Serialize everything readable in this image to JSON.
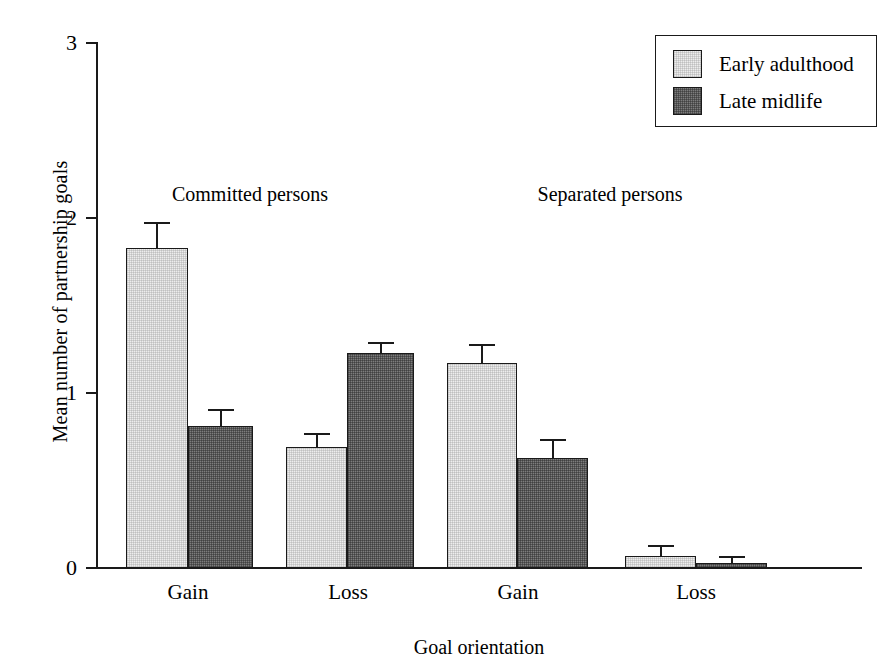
{
  "chart_data": {
    "type": "bar",
    "title": "",
    "xlabel": "Goal orientation",
    "ylabel": "Mean number of partnership goals",
    "ylim": [
      0,
      3
    ],
    "yticks": [
      "0",
      "1",
      "2",
      "3"
    ],
    "ytick_values": [
      0,
      1,
      2,
      3
    ],
    "grid": false,
    "legend_position": "top-right",
    "categories": [
      "Gain",
      "Loss",
      "Gain",
      "Loss"
    ],
    "group_headers": [
      "Committed persons",
      "Separated persons"
    ],
    "series": [
      {
        "name": "Early adulthood",
        "color": "#ededed",
        "values": [
          1.83,
          0.69,
          1.17,
          0.07
        ],
        "errors": [
          0.15,
          0.08,
          0.11,
          0.06
        ]
      },
      {
        "name": "Late midlife",
        "color": "#7d7d7d",
        "values": [
          0.81,
          1.23,
          0.63,
          0.03
        ],
        "errors": [
          0.1,
          0.06,
          0.11,
          0.04
        ]
      }
    ]
  },
  "axes": {
    "y_title": "Mean number of partnership goals",
    "x_title": "Goal orientation",
    "y_tick_labels": [
      "3",
      "2",
      "1",
      "0"
    ]
  },
  "legend": {
    "items": [
      {
        "label": "Early adulthood"
      },
      {
        "label": "Late midlife"
      }
    ]
  },
  "category_labels": [
    "Gain",
    "Loss",
    "Gain",
    "Loss"
  ],
  "group_headers": [
    "Committed persons",
    "Separated persons"
  ],
  "geometry": {
    "baseline_y": 568,
    "pixels_per_unit": 175,
    "bars": [
      {
        "left": 126,
        "width": 62,
        "series": 0,
        "group": 0
      },
      {
        "left": 188,
        "width": 65,
        "series": 1,
        "group": 0
      },
      {
        "left": 286,
        "width": 61,
        "series": 0,
        "group": 1
      },
      {
        "left": 347,
        "width": 67,
        "series": 1,
        "group": 1
      },
      {
        "left": 447,
        "width": 70,
        "series": 0,
        "group": 2
      },
      {
        "left": 517,
        "width": 71,
        "series": 1,
        "group": 2
      },
      {
        "left": 625,
        "width": 71,
        "series": 0,
        "group": 3
      },
      {
        "left": 696,
        "width": 71,
        "series": 1,
        "group": 3
      }
    ],
    "category_label_centers": [
      188,
      348,
      518,
      696
    ]
  }
}
